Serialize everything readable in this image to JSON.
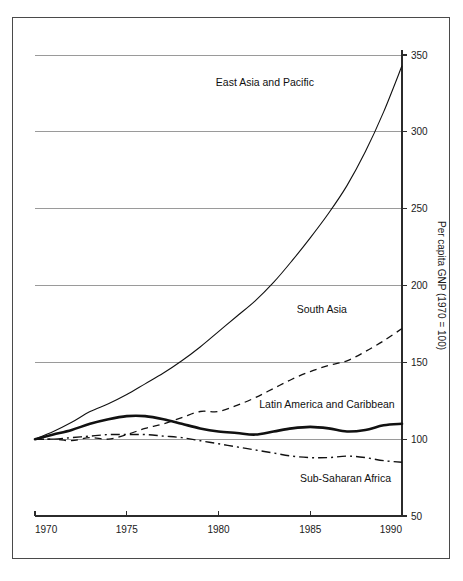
{
  "chart_data": {
    "type": "line",
    "title": "",
    "subtitle": "",
    "xlabel": "",
    "ylabel": "Per capita GNP (1970 = 100)",
    "xlim": [
      1970,
      1990
    ],
    "ylim": [
      50,
      350
    ],
    "grid": "horizontal",
    "legend_position": "inline-annotations",
    "xticks": [
      "1970",
      "1975",
      "1980",
      "1985",
      "1990"
    ],
    "xtick_values": [
      1970,
      1975,
      1980,
      1985,
      1990
    ],
    "yticks": [
      "50",
      "100",
      "150",
      "200",
      "250",
      "300",
      "350"
    ],
    "ytick_values": [
      50,
      100,
      150,
      200,
      250,
      300,
      350
    ],
    "x": [
      1970,
      1971,
      1972,
      1973,
      1974,
      1975,
      1976,
      1977,
      1978,
      1979,
      1980,
      1981,
      1982,
      1983,
      1984,
      1985,
      1986,
      1987,
      1988,
      1989,
      1990
    ],
    "series": [
      {
        "name": "East Asia and Pacific",
        "style": "solid-thin",
        "values": [
          100,
          105,
          111,
          118,
          123,
          129,
          136,
          143,
          151,
          160,
          170,
          180,
          190,
          202,
          216,
          231,
          247,
          265,
          287,
          313,
          343
        ]
      },
      {
        "name": "South Asia",
        "style": "dashed",
        "values": [
          100,
          100,
          99,
          101,
          100,
          103,
          107,
          110,
          114,
          118,
          118,
          122,
          127,
          133,
          139,
          144,
          148,
          151,
          157,
          164,
          172
        ]
      },
      {
        "name": "Latin America and Caribbean",
        "style": "solid-thick",
        "values": [
          100,
          103,
          106,
          110,
          113,
          115,
          115,
          113,
          110,
          107,
          105,
          104,
          103,
          105,
          107,
          108,
          107,
          105,
          106,
          109,
          110
        ]
      },
      {
        "name": "Sub-Saharan Africa",
        "style": "dash-dot",
        "values": [
          100,
          100,
          101,
          102,
          103,
          103,
          103,
          102,
          101,
          99,
          97,
          95,
          93,
          91,
          89,
          88,
          88,
          89,
          88,
          86,
          85
        ]
      }
    ],
    "annotations": [
      {
        "text": "East Asia and Pacific",
        "x": 1985.2,
        "y": 330,
        "anchor": "end"
      },
      {
        "text": "South Asia",
        "x": 1987.0,
        "y": 182,
        "anchor": "end"
      },
      {
        "text": "Latin America and Caribbean",
        "x": 1989.6,
        "y": 120,
        "anchor": "end"
      },
      {
        "text": "Sub-Saharan Africa",
        "x": 1989.4,
        "y": 72,
        "anchor": "end"
      }
    ]
  },
  "colors": {
    "line": "#111111",
    "grid": "#9a9a9a",
    "axis": "#2b2b2b",
    "frame": "#4a4a4a",
    "background": "#ffffff"
  }
}
